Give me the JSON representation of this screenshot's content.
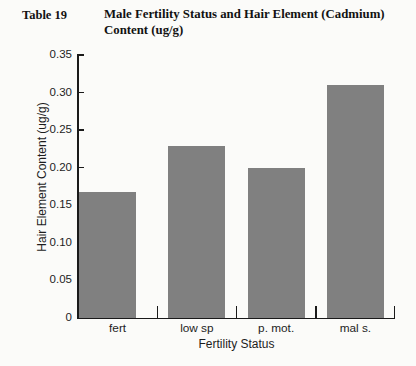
{
  "caption": {
    "number": "Table 19",
    "text": "Male Fertility Status and Hair Element (Cadmium) Content (ug/g)"
  },
  "chart_data": {
    "type": "bar",
    "title": "Male Fertility Status and Hair Element (Cadmium) Content (ug/g)",
    "categories": [
      "fert",
      "low sp",
      "p. mot.",
      "mal s."
    ],
    "values": [
      0.168,
      0.229,
      0.199,
      0.31
    ],
    "series": [
      {
        "name": "Hair Element Content (ug/g)",
        "values": [
          0.168,
          0.229,
          0.199,
          0.31
        ]
      }
    ],
    "xlabel": "Fertility Status",
    "ylabel": "Hair Element Content (ug/g)",
    "ylim": [
      0,
      0.35
    ],
    "yticks": [
      0,
      0.05,
      0.1,
      0.15,
      0.2,
      0.25,
      0.3,
      0.35
    ],
    "ytick_labels": [
      "0",
      "0.05",
      "0.10",
      "0.15",
      "0.20",
      "0.25",
      "0.30",
      "0.35"
    ],
    "grid": false,
    "legend": false,
    "bar_color": "#808080",
    "axis_color": "#1a1a1a",
    "background": "#fbfbf9"
  }
}
